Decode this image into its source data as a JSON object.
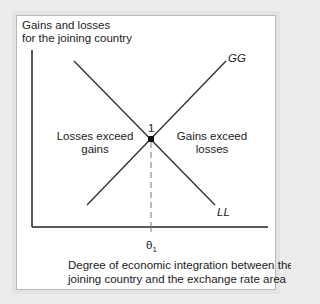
{
  "diagram": {
    "y_axis_label_line1": "Gains and losses",
    "y_axis_label_line2": "for the joining country",
    "x_axis_label_line1": "Degree of economic integration between the",
    "x_axis_label_line2": "joining country and the exchange rate area",
    "curve_gg_label": "GG",
    "curve_ll_label": "LL",
    "intersection_label": "1",
    "threshold_label": "θ",
    "threshold_subscript": "1",
    "region_left_line1": "Losses exceed",
    "region_left_line2": "gains",
    "region_right_line1": "Gains exceed",
    "region_right_line2": "losses"
  },
  "colors": {
    "line": "#333333",
    "axis": "#222222",
    "dashed": "#777777",
    "panel_bg": "#ffffff",
    "outer_bg": "#ececec"
  }
}
